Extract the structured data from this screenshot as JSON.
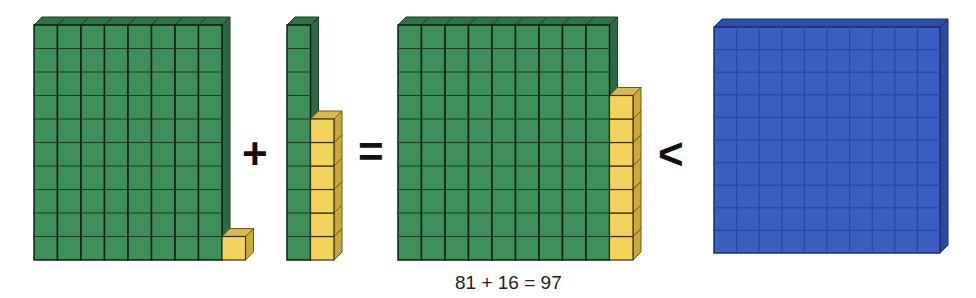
{
  "diagram": {
    "groups": [
      {
        "id": "addend1",
        "tens": 8,
        "ones": 1,
        "value": 81
      },
      {
        "id": "addend2",
        "tens": 1,
        "ones": 6,
        "value": 16
      },
      {
        "id": "sum",
        "tens": 9,
        "ones": 7,
        "value": 97
      },
      {
        "id": "hundred",
        "hundreds": 1,
        "value": 100
      }
    ],
    "operators": {
      "plus": "+",
      "equals": "=",
      "less_than": "<"
    },
    "caption": "81 + 16 = 97",
    "colors": {
      "tens": "#3f8f5b",
      "ones": "#f2d45c",
      "hundred": "#3a5fc0",
      "grid": "#1a2a1a"
    }
  }
}
